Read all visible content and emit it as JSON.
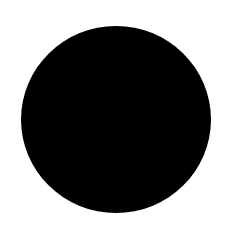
{
  "canvas": {
    "background_color": "#ffffff"
  },
  "shapes": [
    {
      "type": "circle",
      "fill_color": "#000000"
    }
  ]
}
